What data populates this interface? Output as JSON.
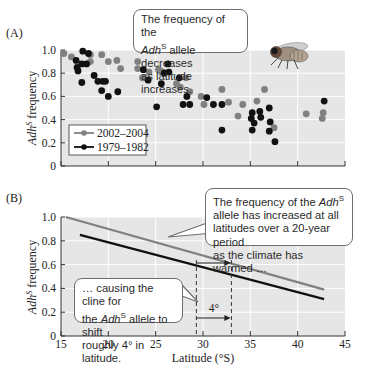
{
  "panels": {
    "a": {
      "label": "(A)",
      "callout": {
        "line1": "The frequency of the",
        "allele_name": "Adh",
        "allele_sup": "S",
        "line2_rest": " allele decreases",
        "line3": "as latitude increases."
      },
      "legend": [
        {
          "label": "2002–2004",
          "color": "#808080"
        },
        {
          "label": "1979–1982",
          "color": "#111111"
        }
      ],
      "image": "fruit-fly-illustration"
    },
    "b": {
      "label": "(B)",
      "callout_top": {
        "line1_prefix": "The frequency of the ",
        "allele_name": "Adh",
        "allele_sup": "S",
        "line2": "allele has increased at all",
        "line3": "latitudes over a 20-year period",
        "line4": "as the climate has warmed …"
      },
      "callout_bottom": {
        "line1": "… causing the cline for",
        "line2_prefix": "the ",
        "allele_name": "Adh",
        "allele_sup": "S",
        "line2_suffix": " allele to shift",
        "line3": "roughly 4° in latitude."
      },
      "shift_label": "4°"
    }
  },
  "chart_data": [
    {
      "type": "scatter",
      "title": "(A)",
      "xlabel": "Latitude (°S)",
      "ylabel": "AdhS frequency",
      "xlim": [
        15,
        45
      ],
      "ylim": [
        0,
        1.0
      ],
      "xticks": [
        15,
        20,
        25,
        30,
        35,
        40,
        45
      ],
      "yticks": [
        0,
        0.2,
        0.4,
        0.6,
        0.8,
        1.0
      ],
      "ytick_labels": [
        "0",
        "0.2",
        "0.4",
        "0.6",
        "0.8",
        "1.0"
      ],
      "grid": true,
      "legend_position": "lower left",
      "annotation": "The frequency of the AdhS allele decreases as latitude increases.",
      "series": [
        {
          "name": "2002–2004",
          "color": "#808080",
          "points": [
            [
              15.3,
              0.97
            ],
            [
              16.1,
              0.94
            ],
            [
              18.1,
              0.96
            ],
            [
              18.1,
              0.9
            ],
            [
              19.3,
              0.96
            ],
            [
              20.0,
              0.9
            ],
            [
              20.9,
              0.91
            ],
            [
              21.3,
              0.84
            ],
            [
              23.1,
              0.9
            ],
            [
              23.1,
              0.84
            ],
            [
              23.6,
              0.76
            ],
            [
              23.7,
              0.76
            ],
            [
              24.3,
              0.81
            ],
            [
              25.3,
              0.83
            ],
            [
              25.5,
              0.82
            ],
            [
              25.8,
              0.81
            ],
            [
              27.2,
              0.71
            ],
            [
              27.6,
              0.68
            ],
            [
              28.2,
              0.76
            ],
            [
              28.6,
              0.64
            ],
            [
              29.8,
              0.6
            ],
            [
              30.1,
              0.53
            ],
            [
              32.0,
              0.66
            ],
            [
              32.7,
              0.55
            ],
            [
              33.7,
              0.43
            ],
            [
              34.2,
              0.53
            ],
            [
              35.7,
              0.56
            ],
            [
              36.5,
              0.66
            ],
            [
              37.5,
              0.33
            ],
            [
              40.9,
              0.45
            ],
            [
              42.7,
              0.46
            ],
            [
              42.6,
              0.41
            ]
          ]
        },
        {
          "name": "1979–1982",
          "color": "#111111",
          "points": [
            [
              17.3,
              0.99
            ],
            [
              17.9,
              0.97
            ],
            [
              16.6,
              0.91
            ],
            [
              16.7,
              0.85
            ],
            [
              16.8,
              0.82
            ],
            [
              17.2,
              0.72
            ],
            [
              17.2,
              0.88
            ],
            [
              17.7,
              0.88
            ],
            [
              18.5,
              0.78
            ],
            [
              18.9,
              0.73
            ],
            [
              19.4,
              0.73
            ],
            [
              19.7,
              0.73
            ],
            [
              19.3,
              0.65
            ],
            [
              20.0,
              0.6
            ],
            [
              21.0,
              0.64
            ],
            [
              23.7,
              0.83
            ],
            [
              24.2,
              0.74
            ],
            [
              25.1,
              0.51
            ],
            [
              25.6,
              0.71
            ],
            [
              25.9,
              0.8
            ],
            [
              26.3,
              0.88
            ],
            [
              26.4,
              0.81
            ],
            [
              27.5,
              0.76
            ],
            [
              27.9,
              0.53
            ],
            [
              28.3,
              0.6
            ],
            [
              28.6,
              0.53
            ],
            [
              30.4,
              0.59
            ],
            [
              31.1,
              0.53
            ],
            [
              32.0,
              0.53
            ],
            [
              32.0,
              0.31
            ],
            [
              35.1,
              0.41
            ],
            [
              35.2,
              0.46
            ],
            [
              35.2,
              0.31
            ],
            [
              35.4,
              0.37
            ],
            [
              36.0,
              0.47
            ],
            [
              36.1,
              0.42
            ],
            [
              37.0,
              0.5
            ],
            [
              37.0,
              0.3
            ],
            [
              37.1,
              0.38
            ],
            [
              37.6,
              0.21
            ],
            [
              42.8,
              0.56
            ]
          ]
        }
      ]
    },
    {
      "type": "line",
      "title": "(B)",
      "xlabel": "Latitude (°S)",
      "ylabel": "AdhS frequency",
      "xlim": [
        15,
        45
      ],
      "ylim": [
        0,
        1.0
      ],
      "xticks": [
        15,
        20,
        25,
        30,
        35,
        40,
        45
      ],
      "xtick_labels": [
        "15",
        "20",
        "25",
        "30",
        "35",
        "40",
        "45"
      ],
      "yticks": [
        0,
        0.2,
        0.4,
        0.6,
        0.8,
        1.0
      ],
      "ytick_labels": [
        "0",
        "0.2",
        "0.4",
        "0.6",
        "0.8",
        "1.0"
      ],
      "grid": true,
      "series": [
        {
          "name": "2002–2004 (recent cline)",
          "color": "#808080",
          "x": [
            15.5,
            42.8
          ],
          "y": [
            1.0,
            0.39
          ]
        },
        {
          "name": "1979–1982 (earlier cline)",
          "color": "#111111",
          "x": [
            17.0,
            42.8
          ],
          "y": [
            0.85,
            0.31
          ]
        }
      ],
      "reference_lines": [
        {
          "type": "vertical-dashed",
          "x": 29.3
        },
        {
          "type": "vertical-dashed",
          "x": 33.0
        }
      ],
      "annotations": [
        {
          "text": "The frequency of the AdhS allele has increased at all latitudes over a 20-year period as the climate has warmed …"
        },
        {
          "text": "… causing the cline for the AdhS allele to shift roughly 4° in latitude."
        },
        {
          "text": "4°",
          "type": "arrow",
          "from_x": 29.3,
          "to_x": 33.0
        }
      ]
    }
  ]
}
